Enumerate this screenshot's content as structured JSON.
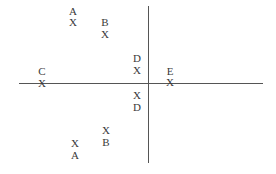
{
  "diagram": {
    "axes": {
      "horizontal": {
        "x1": 19,
        "x2": 263,
        "y": 83
      },
      "vertical": {
        "x": 148,
        "y1": 6,
        "y2": 163
      },
      "color": "#555555"
    },
    "marker_glyph": "X",
    "points": [
      {
        "id": "A-top",
        "label": "A",
        "label_pos": [
          73,
          11
        ],
        "marker_pos": [
          73,
          22
        ]
      },
      {
        "id": "B-top",
        "label": "B",
        "label_pos": [
          105,
          22
        ],
        "marker_pos": [
          105,
          34
        ]
      },
      {
        "id": "C",
        "label": "C",
        "label_pos": [
          42,
          71
        ],
        "marker_pos": [
          42,
          83
        ]
      },
      {
        "id": "D-top",
        "label": "D",
        "label_pos": [
          137,
          58
        ],
        "marker_pos": [
          137,
          70
        ]
      },
      {
        "id": "E",
        "label": "E",
        "label_pos": [
          170,
          71
        ],
        "marker_pos": [
          170,
          82
        ]
      },
      {
        "id": "D-bottom",
        "label": "D",
        "label_pos": [
          137,
          107
        ],
        "marker_pos": [
          137,
          95
        ]
      },
      {
        "id": "B-bottom",
        "label": "B",
        "label_pos": [
          106,
          142
        ],
        "marker_pos": [
          106,
          130
        ]
      },
      {
        "id": "A-bottom",
        "label": "A",
        "label_pos": [
          75,
          155
        ],
        "marker_pos": [
          75,
          143
        ]
      }
    ]
  }
}
